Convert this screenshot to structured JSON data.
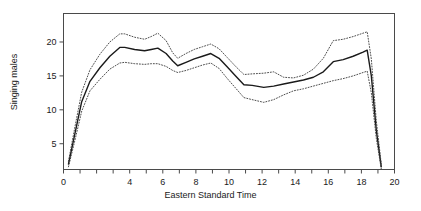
{
  "chart_data": {
    "type": "line",
    "title": "",
    "xlabel": "Eastern Standard Time",
    "ylabel": "Singing males",
    "xlim": [
      0,
      20
    ],
    "ylim": [
      1.2,
      24.2
    ],
    "grid": false,
    "legend": null,
    "xticks": [
      0,
      1,
      2,
      3,
      4,
      5,
      6,
      7,
      8,
      9,
      10,
      11,
      12,
      13,
      14,
      15,
      16,
      17,
      18,
      19,
      20
    ],
    "xticklabels": [
      "0",
      "",
      "",
      "",
      "4",
      "",
      "6",
      "",
      "8",
      "",
      "10",
      "",
      "12",
      "",
      "14",
      "",
      "16",
      "",
      "18",
      "",
      "20"
    ],
    "yticks": [
      5,
      10,
      15,
      20
    ],
    "yticklabels": [
      "5",
      "10",
      "15",
      "20"
    ],
    "x": [
      0.3,
      0.7,
      1.1,
      1.6,
      2.2,
      2.8,
      3.4,
      3.7,
      4.3,
      4.9,
      5.3,
      5.7,
      6.2,
      6.6,
      6.9,
      7.4,
      7.9,
      8.4,
      8.9,
      9.4,
      9.9,
      10.4,
      10.9,
      11.4,
      12.1,
      12.7,
      13.3,
      13.9,
      14.5,
      15.1,
      15.7,
      16.3,
      16.9,
      17.5,
      18.1,
      18.35,
      18.6,
      18.9,
      19.2
    ],
    "series": [
      {
        "name": "mean",
        "style": "solid",
        "values": [
          2.0,
          6.6,
          11.2,
          14.2,
          16.2,
          17.9,
          19.2,
          19.2,
          18.9,
          18.7,
          18.9,
          19.1,
          18.3,
          17.2,
          16.5,
          17.0,
          17.5,
          17.9,
          18.3,
          17.6,
          16.3,
          15.0,
          13.7,
          13.6,
          13.3,
          13.5,
          13.8,
          14.1,
          14.4,
          14.8,
          15.6,
          17.1,
          17.4,
          17.9,
          18.5,
          18.8,
          15.0,
          7.0,
          1.6
        ]
      },
      {
        "name": "upper",
        "style": "dotted",
        "values": [
          2.4,
          7.6,
          12.6,
          15.9,
          18.2,
          20.0,
          21.2,
          21.2,
          20.7,
          20.4,
          20.8,
          21.3,
          20.2,
          18.4,
          17.6,
          18.3,
          18.9,
          19.3,
          19.7,
          19.0,
          17.7,
          16.4,
          15.2,
          15.3,
          15.4,
          15.6,
          14.8,
          14.7,
          15.1,
          16.0,
          17.6,
          20.2,
          20.4,
          20.8,
          21.3,
          21.5,
          17.5,
          8.4,
          2.0
        ]
      },
      {
        "name": "lower",
        "style": "dotted",
        "values": [
          1.6,
          5.6,
          9.8,
          12.8,
          14.5,
          16.0,
          16.9,
          17.0,
          16.8,
          16.7,
          16.8,
          16.8,
          16.4,
          15.8,
          15.5,
          15.8,
          16.2,
          16.6,
          16.9,
          16.1,
          14.6,
          13.2,
          11.8,
          11.5,
          11.1,
          11.5,
          12.2,
          12.8,
          13.1,
          13.5,
          13.9,
          14.3,
          14.6,
          15.0,
          15.5,
          15.7,
          12.5,
          5.8,
          1.3
        ]
      }
    ]
  },
  "style": {
    "frame_color": "#4a4a4a",
    "line_color": "#1a1a1a",
    "band_color": "#3a3a3a",
    "background": "#ffffff",
    "text_color": "#1a1a1a"
  }
}
